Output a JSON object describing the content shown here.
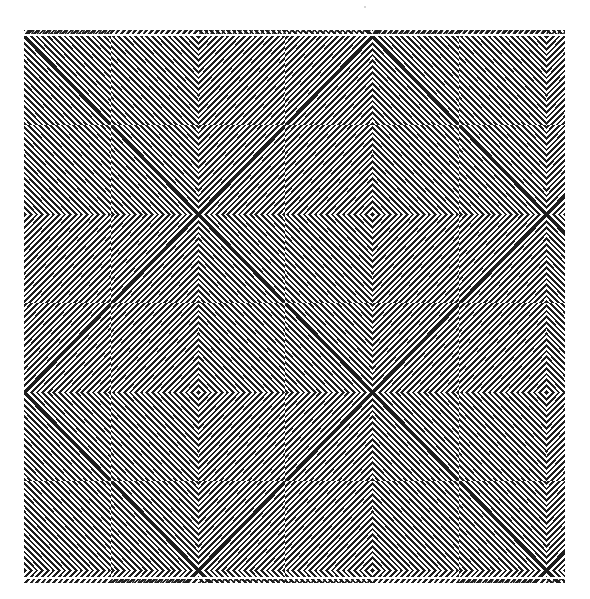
{
  "artwork": {
    "subject": "op-art nested diamond and chevron maze pattern",
    "ink_color": "#1e1e1e",
    "paper_color": "#ffffff",
    "stripe_period_px": 5.6,
    "stripe_duty": 0.48,
    "frame": {
      "left": 24,
      "top": 30,
      "width": 541,
      "height": 553
    },
    "grid": {
      "cell_width": 174,
      "cell_height": 178,
      "origin_x": 198,
      "origin_y": 214
    },
    "motifs": [
      {
        "col": 0,
        "row": 0,
        "type": "x"
      },
      {
        "col": 1,
        "row": 0,
        "type": "diamond"
      },
      {
        "col": -1,
        "row": 0,
        "type": "diamond"
      },
      {
        "col": 2,
        "row": 0,
        "type": "x"
      },
      {
        "col": 0,
        "row": 1,
        "type": "diamond"
      },
      {
        "col": 1,
        "row": 1,
        "type": "x"
      },
      {
        "col": -1,
        "row": 1,
        "type": "x"
      },
      {
        "col": 2,
        "row": 1,
        "type": "diamond"
      },
      {
        "col": 0,
        "row": -1,
        "type": "diamond"
      },
      {
        "col": 1,
        "row": -1,
        "type": "x"
      },
      {
        "col": -1,
        "row": -1,
        "type": "x"
      },
      {
        "col": 2,
        "row": -1,
        "type": "diamond"
      },
      {
        "col": 0,
        "row": 2,
        "type": "x"
      },
      {
        "col": 1,
        "row": 2,
        "type": "diamond"
      },
      {
        "col": -1,
        "row": 2,
        "type": "diamond"
      },
      {
        "col": 2,
        "row": 2,
        "type": "x"
      }
    ]
  }
}
